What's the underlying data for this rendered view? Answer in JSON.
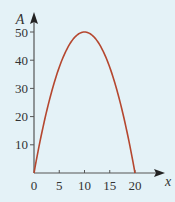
{
  "chart_data": {
    "type": "line",
    "title": "",
    "xlabel": "x",
    "ylabel": "A",
    "xlim": [
      0,
      20
    ],
    "ylim": [
      0,
      50
    ],
    "xticks": [
      0,
      5,
      10,
      15,
      20
    ],
    "yticks": [
      10,
      20,
      30,
      40,
      50
    ],
    "grid": false,
    "series": [
      {
        "name": "A",
        "function": "A = x(20 - x)/2",
        "x": [
          0,
          2,
          4,
          6,
          8,
          10,
          12,
          14,
          16,
          18,
          20
        ],
        "values": [
          0,
          18,
          32,
          42,
          48,
          50,
          48,
          42,
          32,
          18,
          0
        ]
      }
    ]
  },
  "colors": {
    "background": "#e4f2f7",
    "curve": "#b5472f",
    "axis": "#555555"
  }
}
